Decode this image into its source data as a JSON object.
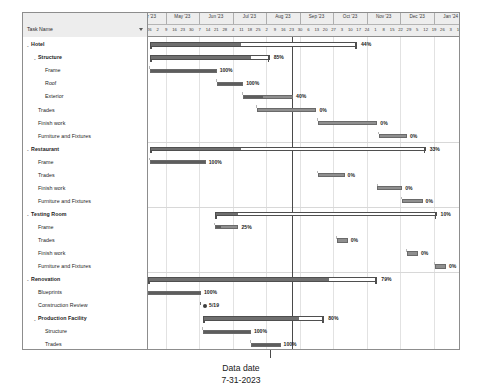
{
  "chart_data": {
    "type": "gantt",
    "title": "",
    "column_header": "Task Name",
    "data_date_label": "Data date",
    "data_date_value": "7-31-2023",
    "data_date_x_pct": 46.2,
    "timeline": {
      "months": [
        "Apr '23",
        "May '23",
        "Jun '23",
        "Jul '23",
        "Aug '23",
        "Sep '23",
        "Oct '23",
        "Nov '23",
        "Dec '23",
        "Jan '24"
      ],
      "day_ticks": [
        "19",
        "26",
        "2",
        "9",
        "16",
        "23",
        "30",
        "7",
        "14",
        "21",
        "28",
        "4",
        "11",
        "18",
        "25",
        "2",
        "9",
        "16",
        "23",
        "30",
        "6",
        "13",
        "20",
        "27",
        "3",
        "10",
        "17",
        "24",
        "1",
        "8",
        "15",
        "22",
        "29",
        "5",
        "12",
        "19",
        "26",
        "3",
        "10",
        "17",
        "24",
        "31",
        "7"
      ]
    },
    "rows": [
      {
        "name": "Hotel",
        "level": 0,
        "type": "summary",
        "start": 0.5,
        "end": 67.0,
        "progress": 44,
        "label": "44%"
      },
      {
        "name": "Structure",
        "level": 1,
        "type": "summary",
        "start": 0.5,
        "end": 39.0,
        "progress": 85,
        "label": "85%"
      },
      {
        "name": "Frame",
        "level": 2,
        "type": "task",
        "start": 0.5,
        "end": 22.0,
        "progress": 100,
        "label": "100%"
      },
      {
        "name": "Roof",
        "level": 2,
        "type": "task",
        "start": 22.0,
        "end": 30.5,
        "progress": 100,
        "label": "100%"
      },
      {
        "name": "Exterior",
        "level": 2,
        "type": "task",
        "start": 30.5,
        "end": 46.5,
        "progress": 40,
        "label": "40%"
      },
      {
        "name": "Trades",
        "level": 1,
        "type": "task",
        "start": 35.0,
        "end": 54.0,
        "progress": 0,
        "label": "0%"
      },
      {
        "name": "Finish work",
        "level": 1,
        "type": "task",
        "start": 54.5,
        "end": 73.5,
        "progress": 0,
        "label": "0%"
      },
      {
        "name": "Furniture and Fixtures",
        "level": 1,
        "type": "task",
        "start": 74.0,
        "end": 83.0,
        "progress": 0,
        "label": "0%"
      },
      {
        "name": "Restaurant",
        "level": 0,
        "type": "summary",
        "start": 0.5,
        "end": 89.0,
        "progress": 33,
        "label": "33%"
      },
      {
        "name": "Frame",
        "level": 1,
        "type": "task",
        "start": 0.5,
        "end": 18.5,
        "progress": 100,
        "label": "100%"
      },
      {
        "name": "Trades",
        "level": 1,
        "type": "task",
        "start": 54.5,
        "end": 63.0,
        "progress": 0,
        "label": "0%"
      },
      {
        "name": "Finish work",
        "level": 1,
        "type": "task",
        "start": 73.5,
        "end": 81.5,
        "progress": 0,
        "label": "0%"
      },
      {
        "name": "Furniture and Fixtures",
        "level": 1,
        "type": "task",
        "start": 81.5,
        "end": 88.0,
        "progress": 0,
        "label": "0%"
      },
      {
        "name": "Testing Room",
        "level": 0,
        "type": "summary",
        "start": 21.5,
        "end": 92.5,
        "progress": 10,
        "label": "10%"
      },
      {
        "name": "Frame",
        "level": 1,
        "type": "task",
        "start": 21.5,
        "end": 29.0,
        "progress": 25,
        "label": "25%"
      },
      {
        "name": "Trades",
        "level": 1,
        "type": "task",
        "start": 60.5,
        "end": 64.0,
        "progress": 0,
        "label": "0%"
      },
      {
        "name": "Finish work",
        "level": 1,
        "type": "task",
        "start": 83.0,
        "end": 86.5,
        "progress": 0,
        "label": "0%"
      },
      {
        "name": "Furniture and Fixtures",
        "level": 1,
        "type": "task",
        "start": 92.0,
        "end": 95.5,
        "progress": 0,
        "label": "0%"
      },
      {
        "name": "Renovation",
        "level": 0,
        "type": "summary",
        "start": 0.0,
        "end": 73.5,
        "progress": 79,
        "label": "79%"
      },
      {
        "name": "Blueprints",
        "level": 1,
        "type": "task",
        "start": 0.0,
        "end": 17.0,
        "progress": 100,
        "label": "100%"
      },
      {
        "name": "Construction Review",
        "level": 1,
        "type": "milestone",
        "start": 17.5,
        "end": 17.5,
        "progress": 100,
        "label": "5/19"
      },
      {
        "name": "Production Facility",
        "level": 1,
        "type": "summary",
        "start": 17.5,
        "end": 56.5,
        "progress": 80,
        "label": "80%"
      },
      {
        "name": "Structure",
        "level": 2,
        "type": "task",
        "start": 17.5,
        "end": 33.0,
        "progress": 100,
        "label": "100%"
      },
      {
        "name": "Trades",
        "level": 2,
        "type": "task",
        "start": 33.0,
        "end": 42.5,
        "progress": 100,
        "label": "100%"
      },
      {
        "name": "Finish work",
        "level": 2,
        "type": "task",
        "start": 42.5,
        "end": 47.0,
        "progress": 100,
        "label": "100%"
      },
      {
        "name": "Equipment",
        "level": 2,
        "type": "task",
        "start": 47.0,
        "end": 53.0,
        "progress": 0,
        "label": "0%"
      },
      {
        "name": "Storage Facility",
        "level": 1,
        "type": "summary",
        "start": 17.5,
        "end": 51.5,
        "progress": 63,
        "label": "63%"
      },
      {
        "name": "Structure",
        "level": 2,
        "type": "task",
        "start": 17.5,
        "end": 33.5,
        "progress": 100,
        "label": "100%"
      },
      {
        "name": "Trades",
        "level": 2,
        "type": "task",
        "start": 33.5,
        "end": 41.0,
        "progress": 50,
        "label": "50%"
      },
      {
        "name": "Finish work",
        "level": 2,
        "type": "task",
        "start": 41.0,
        "end": 45.5,
        "progress": 0,
        "label": "0%"
      },
      {
        "name": "Equipment",
        "level": 2,
        "type": "task",
        "start": 45.5,
        "end": 49.5,
        "progress": 0,
        "label": "0%"
      },
      {
        "name": "Construction Complete",
        "level": 0,
        "type": "milestone",
        "start": 90.0,
        "end": 90.0,
        "progress": 0,
        "label": "12/1"
      }
    ]
  }
}
